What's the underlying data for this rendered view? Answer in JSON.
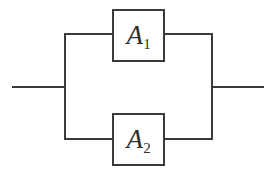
{
  "diagram": {
    "type": "parallel-reliability-block-diagram",
    "stroke_color": "#3a3a3a",
    "background_color": "#ffffff",
    "blocks": [
      {
        "id": "A1",
        "base": "A",
        "subscript": "1",
        "label": "A₁",
        "position": "top-branch"
      },
      {
        "id": "A2",
        "base": "A",
        "subscript": "2",
        "label": "A₂",
        "position": "bottom-branch"
      }
    ],
    "terminals": {
      "input": "",
      "output": ""
    },
    "geometry": {
      "width": 274,
      "height": 175,
      "input_line": {
        "x1": 12,
        "y1": 87,
        "x2": 65,
        "y2": 87
      },
      "output_line": {
        "x1": 212,
        "y1": 87,
        "x2": 264,
        "y2": 87
      },
      "left_bus": {
        "x": 65,
        "y1": 34,
        "y2": 140
      },
      "right_bus": {
        "x": 212,
        "y1": 34,
        "y2": 140
      },
      "top_branch_y": 34,
      "bottom_branch_y": 139,
      "block_a1": {
        "x": 112,
        "y": 9,
        "w": 53,
        "h": 53
      },
      "block_a2": {
        "x": 112,
        "y": 113,
        "w": 53,
        "h": 53
      }
    }
  }
}
